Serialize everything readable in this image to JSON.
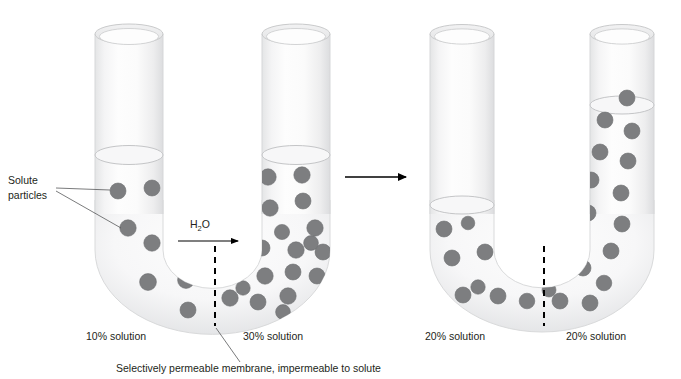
{
  "figure": {
    "name": "osmosis-u-tube-diagram",
    "width": 681,
    "height": 379,
    "background": "#ffffff"
  },
  "colors": {
    "particle_fill": "#7d7e80",
    "particle_stroke": "#6e7072",
    "glass_light": "#fbfbfb",
    "glass_shade": "#e9eaeb",
    "glass_outline": "#d9dadb",
    "text": "#231f20",
    "leader_line": "#58595b",
    "membrane": "#000000"
  },
  "annotations": {
    "solute_callout": {
      "line1": "Solute",
      "line2": "particles"
    },
    "water_flow_label": {
      "pre": "H",
      "sub": "2",
      "post": "O"
    },
    "membrane_caption": "Selectively permeable membrane, impermeable to solute"
  },
  "left_panel": {
    "name": "before-osmosis",
    "labels": {
      "left_solution": "10% solution",
      "right_solution": "30% solution"
    },
    "left_arm": {
      "concentration_percent": 10,
      "liquid_surface_y": 155,
      "particle_count": 9
    },
    "right_arm": {
      "concentration_percent": 30,
      "liquid_surface_y": 155,
      "particle_count": 21
    },
    "membrane_x": 215,
    "water_flow_direction": "left-to-right"
  },
  "right_panel": {
    "name": "after-osmosis",
    "labels": {
      "left_solution": "20% solution",
      "right_solution": "20% solution"
    },
    "left_arm": {
      "concentration_percent": 20,
      "liquid_surface_y": 205,
      "particle_count": 10
    },
    "right_arm": {
      "concentration_percent": 20,
      "liquid_surface_y": 105,
      "particle_count": 22
    },
    "membrane_x": 544
  },
  "transition_arrow": {
    "name": "process-arrow",
    "direction": "right",
    "x1": 345,
    "x2": 406,
    "y": 177
  },
  "particles": {
    "left_panel": [
      {
        "cx": 118,
        "cy": 191,
        "r": 8.0
      },
      {
        "cx": 152,
        "cy": 188,
        "r": 8.0
      },
      {
        "cx": 128,
        "cy": 228,
        "r": 8.2
      },
      {
        "cx": 152,
        "cy": 243,
        "r": 8.2
      },
      {
        "cx": 148,
        "cy": 282,
        "r": 8.4
      },
      {
        "cx": 186,
        "cy": 280,
        "r": 8.4
      },
      {
        "cx": 181,
        "cy": 248,
        "r": 7.8
      },
      {
        "cx": 188,
        "cy": 310,
        "r": 8.0
      },
      {
        "cx": 206,
        "cy": 258,
        "r": 7.6
      },
      {
        "cx": 268,
        "cy": 177,
        "r": 8.2
      },
      {
        "cx": 302,
        "cy": 175,
        "r": 8.2
      },
      {
        "cx": 270,
        "cy": 208,
        "r": 8.2
      },
      {
        "cx": 303,
        "cy": 201,
        "r": 8.0
      },
      {
        "cx": 315,
        "cy": 228,
        "r": 8.2
      },
      {
        "cx": 282,
        "cy": 232,
        "r": 7.6
      },
      {
        "cx": 262,
        "cy": 248,
        "r": 8.0
      },
      {
        "cx": 296,
        "cy": 250,
        "r": 8.2
      },
      {
        "cx": 323,
        "cy": 252,
        "r": 8.0
      },
      {
        "cx": 239,
        "cy": 266,
        "r": 8.2
      },
      {
        "cx": 265,
        "cy": 276,
        "r": 8.2
      },
      {
        "cx": 293,
        "cy": 272,
        "r": 8.0
      },
      {
        "cx": 317,
        "cy": 276,
        "r": 8.0
      },
      {
        "cx": 230,
        "cy": 298,
        "r": 8.2
      },
      {
        "cx": 258,
        "cy": 302,
        "r": 8.0
      },
      {
        "cx": 288,
        "cy": 296,
        "r": 8.2
      },
      {
        "cx": 311,
        "cy": 243,
        "r": 7.4
      },
      {
        "cx": 247,
        "cy": 228,
        "r": 7.6
      },
      {
        "cx": 283,
        "cy": 312,
        "r": 7.4
      },
      {
        "cx": 227,
        "cy": 246,
        "r": 7.4
      },
      {
        "cx": 243,
        "cy": 288,
        "r": 7.2
      }
    ],
    "right_panel": [
      {
        "cx": 444,
        "cy": 229,
        "r": 8.0
      },
      {
        "cx": 452,
        "cy": 258,
        "r": 8.0
      },
      {
        "cx": 485,
        "cy": 252,
        "r": 8.0
      },
      {
        "cx": 463,
        "cy": 295,
        "r": 8.0
      },
      {
        "cx": 498,
        "cy": 296,
        "r": 8.0
      },
      {
        "cx": 519,
        "cy": 267,
        "r": 8.0
      },
      {
        "cx": 527,
        "cy": 301,
        "r": 7.8
      },
      {
        "cx": 478,
        "cy": 287,
        "r": 7.2
      },
      {
        "cx": 508,
        "cy": 230,
        "r": 7.0
      },
      {
        "cx": 468,
        "cy": 223,
        "r": 6.8
      },
      {
        "cx": 556,
        "cy": 267,
        "r": 8.0
      },
      {
        "cx": 560,
        "cy": 301,
        "r": 8.0
      },
      {
        "cx": 590,
        "cy": 303,
        "r": 8.0
      },
      {
        "cx": 583,
        "cy": 268,
        "r": 8.0
      },
      {
        "cx": 604,
        "cy": 283,
        "r": 7.8
      },
      {
        "cx": 611,
        "cy": 251,
        "r": 8.0
      },
      {
        "cx": 577,
        "cy": 240,
        "r": 8.0
      },
      {
        "cx": 622,
        "cy": 224,
        "r": 8.0
      },
      {
        "cx": 588,
        "cy": 213,
        "r": 8.0
      },
      {
        "cx": 621,
        "cy": 193,
        "r": 8.0
      },
      {
        "cx": 591,
        "cy": 180,
        "r": 8.0
      },
      {
        "cx": 628,
        "cy": 161,
        "r": 8.0
      },
      {
        "cx": 600,
        "cy": 152,
        "r": 8.0
      },
      {
        "cx": 632,
        "cy": 131,
        "r": 8.0
      },
      {
        "cx": 605,
        "cy": 120,
        "r": 8.0
      },
      {
        "cx": 627,
        "cy": 98,
        "r": 8.0
      },
      {
        "cx": 549,
        "cy": 290,
        "r": 7.0
      },
      {
        "cx": 535,
        "cy": 240,
        "r": 6.6
      }
    ]
  }
}
